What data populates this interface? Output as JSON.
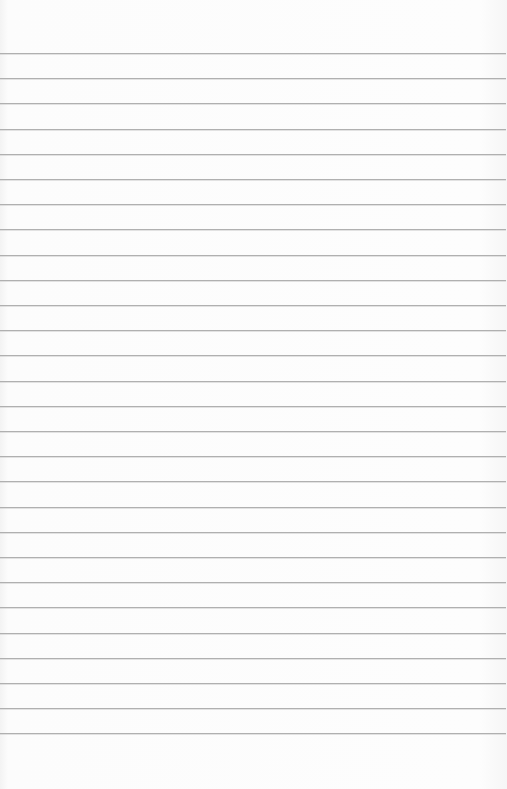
{
  "page": {
    "type": "lined-paper",
    "background_color": "#fbfbfb",
    "rule_color": "#b0b0b0",
    "rule_count": 28,
    "first_rule_y": 53,
    "rule_spacing": 25.2
  }
}
